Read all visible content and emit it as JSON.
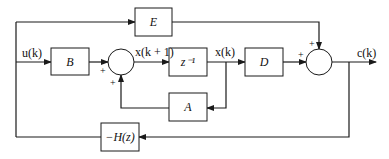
{
  "diagram": {
    "title": "",
    "blocks": {
      "E": "E",
      "B": "B",
      "delay": "z⁻¹",
      "D": "D",
      "A": "A",
      "H": "−H(z)"
    },
    "signals": {
      "input": "u(k)",
      "next_state": "x(k + 1)",
      "state": "x(k)",
      "output": "c(k)"
    },
    "signs": {
      "sum1_from_B": "+",
      "sum1_from_A": "+",
      "sum2_from_E": "+",
      "sum2_from_D": "+"
    },
    "colors": {
      "line": "#1a1a1a",
      "background": "#ffffff"
    }
  }
}
